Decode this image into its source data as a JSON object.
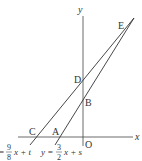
{
  "diagram": {
    "axes": {
      "x_label": "x",
      "y_label": "y",
      "origin_label": "O"
    },
    "points": {
      "A": "A",
      "B": "B",
      "C": "C",
      "D": "D",
      "E": "E"
    },
    "equations": {
      "line_cd": {
        "prefix": "=",
        "numerator": "9",
        "denominator": "8",
        "suffix": "x + t"
      },
      "line_ab": {
        "prefix": "y =",
        "numerator": "3",
        "denominator": "2",
        "suffix": "x + s"
      }
    },
    "colors": {
      "line": "#333333",
      "axis": "#444444",
      "background": "#ffffff"
    }
  }
}
